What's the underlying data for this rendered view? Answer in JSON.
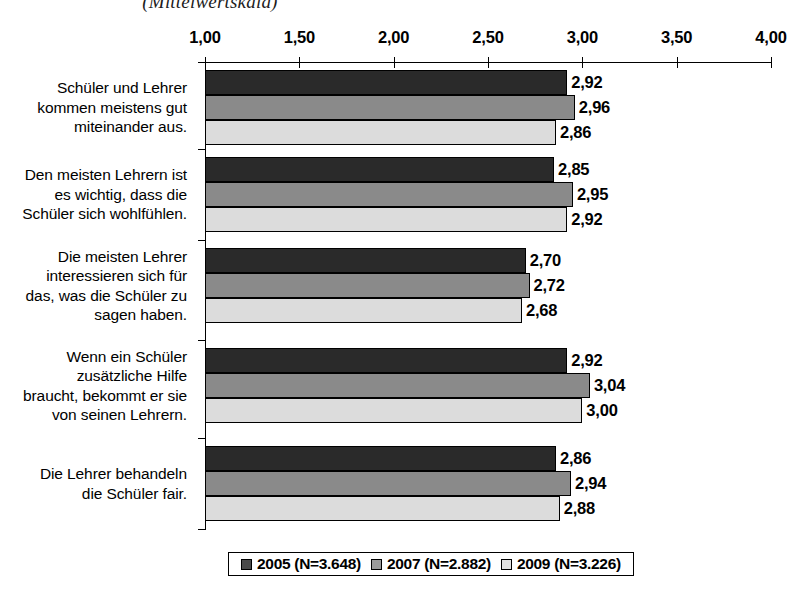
{
  "chart_data": {
    "type": "bar",
    "orientation": "horizontal",
    "title": "(Mittelwertskala)",
    "xlabel": "",
    "ylabel": "",
    "xlim": [
      1.0,
      4.0
    ],
    "xticks": [
      "1,00",
      "1,50",
      "2,00",
      "2,50",
      "3,00",
      "3,50",
      "4,00"
    ],
    "xtick_values": [
      1.0,
      1.5,
      2.0,
      2.5,
      3.0,
      3.5,
      4.0
    ],
    "grid": false,
    "legend_position": "bottom",
    "categories": [
      "Schüler und Lehrer\nkommen meistens gut\nmiteinander aus.",
      "Den meisten Lehrern ist\nes wichtig, dass die\nSchüler sich wohlfühlen.",
      "Die meisten Lehrer\ninteressieren sich für\ndas, was die Schüler zu\nsagen haben.",
      "Wenn ein Schüler\nzusätzliche Hilfe\nbraucht, bekommt er sie\nvon seinen Lehrern.",
      "Die Lehrer behandeln\ndie Schüler fair."
    ],
    "series": [
      {
        "name": "2005 (N=3.648)",
        "color": "#2a2a2a",
        "values": [
          2.92,
          2.85,
          2.7,
          2.92,
          2.86
        ],
        "labels": [
          "2,92",
          "2,85",
          "2,70",
          "2,92",
          "2,86"
        ]
      },
      {
        "name": "2007 (N=2.882)",
        "color": "#8a8a8a",
        "values": [
          2.96,
          2.95,
          2.72,
          3.04,
          2.94
        ],
        "labels": [
          "2,96",
          "2,95",
          "2,72",
          "3,04",
          "2,94"
        ]
      },
      {
        "name": "2009 (N=3.226)",
        "color": "#dcdcdc",
        "values": [
          2.86,
          2.92,
          2.68,
          3.0,
          2.88
        ],
        "labels": [
          "2,86",
          "2,92",
          "2,68",
          "3,00",
          "2,88"
        ]
      }
    ]
  },
  "legend": {
    "entries": [
      {
        "label": "2005 (N=3.648)",
        "swatch": "#4a4a4a"
      },
      {
        "label": "2007 (N=2.882)",
        "swatch": "#9a9a9a"
      },
      {
        "label": "2009 (N=3.226)",
        "swatch": "#e2e2e2"
      }
    ]
  }
}
